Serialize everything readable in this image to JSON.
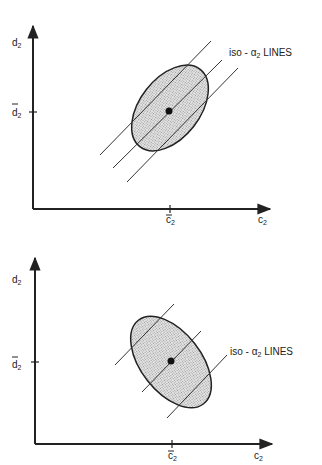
{
  "figure": {
    "panels": [
      {
        "id": "top",
        "description": "Positively correlated ellipse; iso-alpha2 lines nearly parallel to major axis",
        "y_axis_label": {
          "main": "d",
          "sub": "2"
        },
        "x_axis_label": {
          "main": "c",
          "sub": "2"
        },
        "y_mean_label": {
          "main": "d",
          "sub": "2",
          "bar": true
        },
        "x_mean_label": {
          "main": "c",
          "sub": "2",
          "bar": true
        },
        "annotation": {
          "prefix": "iso - ",
          "greek": "α",
          "sub": "2",
          "suffix": " LINES"
        },
        "iso_line_count": 3
      },
      {
        "id": "bottom",
        "description": "Negatively correlated ellipse; iso-alpha2 lines perpendicular to major axis",
        "y_axis_label": {
          "main": "d",
          "sub": "2"
        },
        "x_axis_label": {
          "main": "c",
          "sub": "2"
        },
        "y_mean_label": {
          "main": "d",
          "sub": "2",
          "bar": true
        },
        "x_mean_label": {
          "main": "c",
          "sub": "2",
          "bar": true
        },
        "annotation": {
          "prefix": "iso - ",
          "greek": "α",
          "sub": "2",
          "suffix": " LINES"
        },
        "iso_line_count": 3
      }
    ],
    "colors": {
      "ink": "#222222",
      "fill": "#cfcfcf",
      "background": "#ffffff"
    }
  }
}
